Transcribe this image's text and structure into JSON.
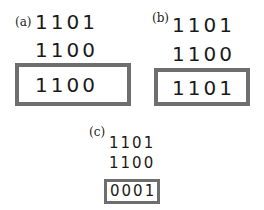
{
  "panels": [
    {
      "label": "(a)",
      "row1": "1101",
      "row2": "1100",
      "result": "1100",
      "operation": "AND"
    },
    {
      "label": "(b)",
      "row1": "1101",
      "row2": "1100",
      "result": "1101",
      "operation": "OR"
    },
    {
      "label": "(c)",
      "row1": "1101",
      "row2": "1100",
      "result": "0001",
      "operation": "XOR"
    }
  ],
  "colors": {
    "box_border": "#6e6e6e",
    "text": "#1a1a1a"
  }
}
